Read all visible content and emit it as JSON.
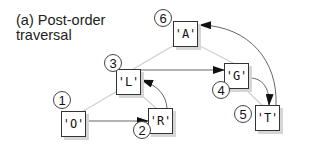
{
  "title": {
    "line1": "(a) Post-order",
    "line2": "traversal"
  },
  "nodes": [
    {
      "id": "A",
      "label": "'A'",
      "order": "6"
    },
    {
      "id": "L",
      "label": "'L'",
      "order": "3"
    },
    {
      "id": "G",
      "label": "'G'",
      "order": "4"
    },
    {
      "id": "O",
      "label": "'O'",
      "order": "1"
    },
    {
      "id": "R",
      "label": "'R'",
      "order": "2"
    },
    {
      "id": "T",
      "label": "'T'",
      "order": "5"
    }
  ],
  "tree_edges": [
    {
      "from": "A",
      "to": "L"
    },
    {
      "from": "A",
      "to": "G"
    },
    {
      "from": "L",
      "to": "O"
    },
    {
      "from": "L",
      "to": "R"
    },
    {
      "from": "G",
      "to": "T"
    }
  ],
  "traversal_arrows": [
    {
      "from": "O",
      "to": "R"
    },
    {
      "from": "R",
      "to": "L"
    },
    {
      "from": "L",
      "to": "G"
    },
    {
      "from": "G",
      "to": "T"
    },
    {
      "from": "T",
      "to": "A"
    }
  ],
  "colors": {
    "tree_edge": "#cfcfcf",
    "arrow": "#444444",
    "node_border": "#333333",
    "shadow": "#d6d6d6"
  }
}
